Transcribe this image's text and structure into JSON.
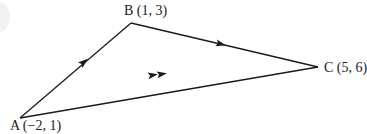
{
  "diagram": {
    "type": "triangle-vectors",
    "stroke_color": "#1a1a1a",
    "points": [
      {
        "id": "A",
        "label": "A (−2, 1)",
        "coords": [
          -2,
          1
        ],
        "px": [
          20,
          118
        ]
      },
      {
        "id": "B",
        "label": "B (1, 3)",
        "coords": [
          1,
          3
        ],
        "px": [
          131,
          23
        ]
      },
      {
        "id": "C",
        "label": "C (5, 6)",
        "coords": [
          5,
          6
        ],
        "px": [
          318,
          67
        ]
      }
    ],
    "edges": [
      {
        "from": "A",
        "to": "B",
        "arrows": 1
      },
      {
        "from": "B",
        "to": "C",
        "arrows": 1
      },
      {
        "from": "A",
        "to": "C",
        "arrows": 2
      }
    ]
  }
}
